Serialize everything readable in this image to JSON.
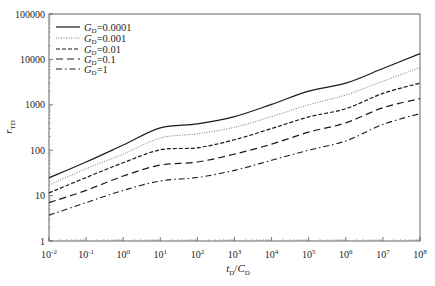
{
  "chart_data": {
    "type": "line",
    "title": "",
    "xlabel": "tD/CD",
    "xlabel_parts": {
      "main1": "t",
      "sub1": "D",
      "sep": "/",
      "main2": "C",
      "sub2": "D"
    },
    "ylabel": "rTD",
    "ylabel_parts": {
      "main": "r",
      "sub": "TD"
    },
    "xscale": "log",
    "yscale": "log",
    "xlim": [
      0.01,
      100000000
    ],
    "ylim": [
      1,
      100000
    ],
    "grid": false,
    "legend_position": "upper left",
    "x_tick_labels": [
      {
        "base": "10",
        "exp": "-2"
      },
      {
        "base": "10",
        "exp": "-1"
      },
      {
        "base": "10",
        "exp": "0"
      },
      {
        "base": "10",
        "exp": "1"
      },
      {
        "base": "10",
        "exp": "2"
      },
      {
        "base": "10",
        "exp": "3"
      },
      {
        "base": "10",
        "exp": "4"
      },
      {
        "base": "10",
        "exp": "5"
      },
      {
        "base": "10",
        "exp": "6"
      },
      {
        "base": "10",
        "exp": "7"
      },
      {
        "base": "10",
        "exp": "8"
      }
    ],
    "y_tick_labels": [
      "1",
      "10",
      "100",
      "1000",
      "10000",
      "100000"
    ],
    "x": [
      0.01,
      0.1,
      1,
      10,
      100,
      1000,
      10000,
      100000,
      1000000,
      10000000,
      100000000
    ],
    "series": [
      {
        "name": "GD=0.0001",
        "label_main": "G",
        "label_sub": "D",
        "label_value": "=0.0001",
        "style": "solid",
        "values": [
          24.6,
          55,
          130,
          310,
          380,
          550,
          1020,
          2000,
          3000,
          6300,
          13400
        ]
      },
      {
        "name": "GD=0.001",
        "label_main": "G",
        "label_sub": "D",
        "label_value": "=0.001",
        "style": "dotted",
        "values": [
          17,
          39,
          82,
          185,
          230,
          320,
          550,
          1000,
          1650,
          3300,
          6600
        ]
      },
      {
        "name": "GD=0.01",
        "label_main": "G",
        "label_sub": "D",
        "label_value": "=0.01",
        "style": "dashed",
        "values": [
          11.5,
          25,
          53,
          102,
          113,
          170,
          300,
          540,
          820,
          1780,
          3000
        ]
      },
      {
        "name": "GD=0.1",
        "label_main": "G",
        "label_sub": "D",
        "label_value": "=0.1",
        "style": "long-dashed",
        "values": [
          7,
          13,
          27,
          47,
          55,
          82,
          136,
          250,
          400,
          860,
          1370
        ]
      },
      {
        "name": "GD=1",
        "label_main": "G",
        "label_sub": "D",
        "label_value": "=1",
        "style": "dash-dot",
        "values": [
          3.7,
          7,
          13,
          21,
          25,
          36,
          60,
          100,
          160,
          370,
          640
        ]
      }
    ],
    "colors": {
      "line": "#1a1a1a",
      "axis": "#555555",
      "dotted": "#777777"
    }
  }
}
